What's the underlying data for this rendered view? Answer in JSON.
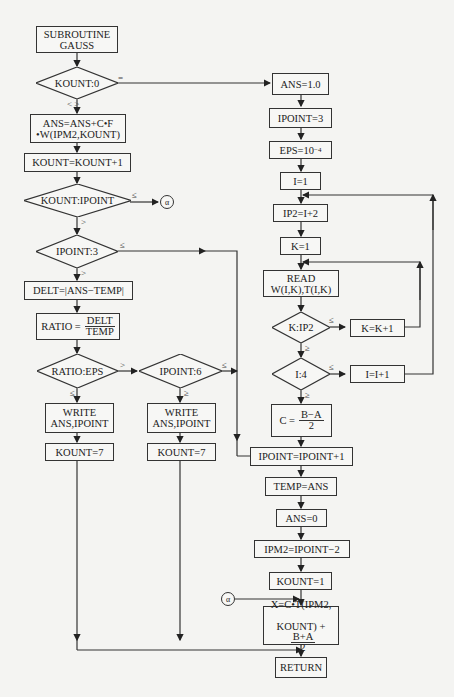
{
  "nodes": {
    "start": "SUBROUTINE\nGAUSS",
    "kount0": "KOUNT:0",
    "ans_accum": "ANS=ANS+C•F\n•W(IPM2,KOUNT)",
    "kount_inc": "KOUNT=KOUNT+1",
    "kount_ipoint": "KOUNT:IPOINT",
    "ipoint3": "IPOINT:3",
    "delt": "DELT=|ANS−TEMP|",
    "ratio_lhs": "RATIO =",
    "ratio_num": "DELT",
    "ratio_den": "TEMP",
    "ratio_eps": "RATIO:EPS",
    "ipoint6": "IPOINT:6",
    "write1": "WRITE\nANS,IPOINT",
    "write2": "WRITE\nANS,IPOINT",
    "kount7a": "KOUNT=7",
    "kount7b": "KOUNT=7",
    "ans1": "ANS=1.0",
    "ipoint_set3": "IPOINT=3",
    "eps_base": "EPS=10",
    "eps_exp": "−4",
    "i1": "I=1",
    "ip2": "IP2=I+2",
    "k1": "K=1",
    "read": "READ\nW(I,K),T(I,K)",
    "k_ip2": "K:IP2",
    "k_inc": "K=K+1",
    "i4": "I:4",
    "i_inc": "I=I+1",
    "c_lhs": "C =",
    "c_num": "B−A",
    "c_den": "2",
    "ipoint_inc": "IPOINT=IPOINT+1",
    "temp": "TEMP=ANS",
    "ans0": "ANS=0",
    "ipm2": "IPM2=IPOINT−2",
    "kount1": "KOUNT=1",
    "x_line1": "X=C•T(IPM2,",
    "x_line2": "KOUNT) +",
    "x_num": "B+A",
    "x_den": "2",
    "return": "RETURN"
  },
  "labels": {
    "eq": "=",
    "ne": "< >",
    "le": "≤",
    "gt": ">",
    "ge": "≥",
    "alpha": "α"
  }
}
